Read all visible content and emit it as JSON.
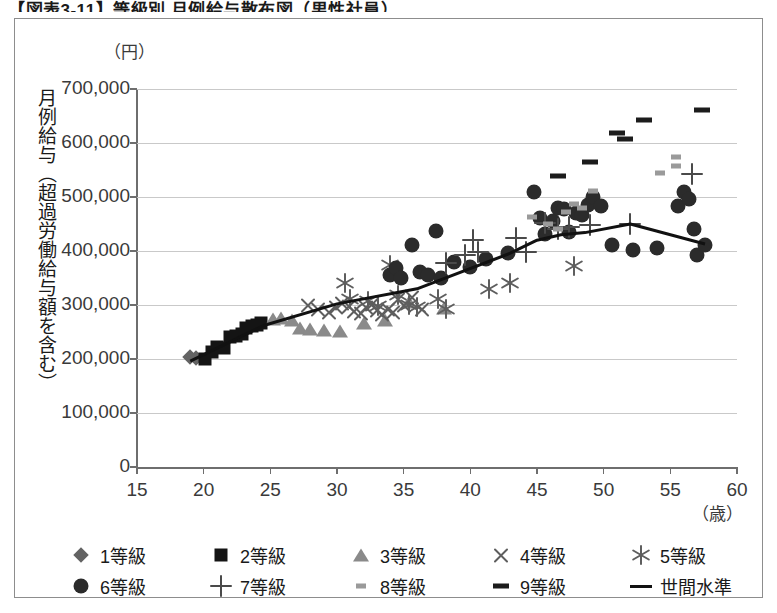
{
  "title": "【図表3-11】等級別 月例給与散布図（男性社員）",
  "axes": {
    "y_unit": "（円）",
    "y_title": "月例給与（超過労働給与額を含む）",
    "x_unit": "（歳）",
    "y_ticks": [
      "700,000",
      "600,000",
      "500,000",
      "400,000",
      "300,000",
      "200,000",
      "100,000",
      "0"
    ],
    "x_ticks": [
      "15",
      "20",
      "25",
      "30",
      "35",
      "40",
      "45",
      "50",
      "55",
      "60"
    ]
  },
  "legend": {
    "rows": [
      [
        {
          "label": "1等級",
          "marker": "diamond"
        },
        {
          "label": "2等級",
          "marker": "square"
        },
        {
          "label": "3等級",
          "marker": "triangle"
        },
        {
          "label": "4等級",
          "marker": "x"
        },
        {
          "label": "5等級",
          "marker": "asterisk"
        }
      ],
      [
        {
          "label": "6等級",
          "marker": "circle"
        },
        {
          "label": "7等級",
          "marker": "plus"
        },
        {
          "label": "8等級",
          "marker": "dash-small"
        },
        {
          "label": "9等級",
          "marker": "dash-large"
        },
        {
          "label": "世間水準",
          "marker": "line"
        }
      ]
    ]
  },
  "chart_data": {
    "type": "scatter",
    "title": "【図表3-11】等級別 月例給与散布図（男性社員）",
    "xlabel": "（歳）",
    "ylabel": "月例給与（超過労働給与額を含む）（円）",
    "xlim": [
      15,
      60
    ],
    "ylim": [
      0,
      700000
    ],
    "xtick_step": 5,
    "ytick_step": 100000,
    "grid": "horizontal",
    "legend_position": "bottom",
    "series": [
      {
        "name": "1等級",
        "marker": "diamond",
        "color": "#636363",
        "points": [
          [
            19.0,
            203000
          ],
          [
            19.4,
            201000
          ]
        ]
      },
      {
        "name": "2等級",
        "marker": "square",
        "color": "#141414",
        "points": [
          [
            20.1,
            200000
          ],
          [
            20.6,
            213000
          ],
          [
            21.0,
            222000
          ],
          [
            21.5,
            221000
          ],
          [
            22.0,
            240000
          ],
          [
            22.4,
            243000
          ],
          [
            22.9,
            247000
          ],
          [
            23.2,
            257000
          ],
          [
            23.6,
            262000
          ],
          [
            24.0,
            263000
          ],
          [
            24.3,
            266000
          ]
        ]
      },
      {
        "name": "3等級",
        "marker": "triangle",
        "color": "#8a8a8a",
        "points": [
          [
            25.2,
            274000
          ],
          [
            25.8,
            276000
          ],
          [
            26.6,
            272000
          ],
          [
            27.2,
            258000
          ],
          [
            28.0,
            256000
          ],
          [
            29.0,
            254000
          ],
          [
            30.2,
            252000
          ],
          [
            32.0,
            267000
          ],
          [
            33.6,
            272000
          ],
          [
            35.4,
            305000
          ],
          [
            38.0,
            294000
          ]
        ]
      },
      {
        "name": "4等級",
        "marker": "x",
        "color": "#5e5e5e",
        "points": [
          [
            27.8,
            300000
          ],
          [
            28.6,
            292000
          ],
          [
            29.4,
            287000
          ],
          [
            29.9,
            296000
          ],
          [
            30.4,
            303000
          ],
          [
            30.9,
            298000
          ],
          [
            31.3,
            288000
          ],
          [
            31.8,
            284000
          ],
          [
            32.2,
            296000
          ],
          [
            32.6,
            301000
          ],
          [
            33.0,
            290000
          ],
          [
            33.4,
            283000
          ],
          [
            33.8,
            292000
          ],
          [
            34.2,
            287000
          ],
          [
            34.6,
            310000
          ],
          [
            35.0,
            300000
          ],
          [
            35.6,
            313000
          ],
          [
            36.4,
            292000
          ]
        ]
      },
      {
        "name": "5等級",
        "marker": "asterisk",
        "color": "#5e5e5e",
        "points": [
          [
            30.6,
            340000
          ],
          [
            31.0,
            312000
          ],
          [
            32.3,
            307000
          ],
          [
            33.1,
            298000
          ],
          [
            34.0,
            375000
          ],
          [
            34.6,
            318000
          ],
          [
            35.4,
            300000
          ],
          [
            36.0,
            296000
          ],
          [
            37.6,
            312000
          ],
          [
            38.2,
            293000
          ],
          [
            41.4,
            330000
          ],
          [
            43.0,
            340000
          ],
          [
            47.8,
            372000
          ]
        ]
      },
      {
        "name": "6等級",
        "marker": "circle",
        "color": "#2b2b2b",
        "points": [
          [
            34.0,
            355000
          ],
          [
            34.4,
            368000
          ],
          [
            34.8,
            350000
          ],
          [
            35.6,
            412000
          ],
          [
            36.2,
            362000
          ],
          [
            36.8,
            355000
          ],
          [
            37.4,
            437000
          ],
          [
            37.8,
            350000
          ],
          [
            38.8,
            380000
          ],
          [
            40.0,
            370000
          ],
          [
            41.2,
            386000
          ],
          [
            42.8,
            396000
          ],
          [
            44.8,
            510000
          ],
          [
            45.2,
            462000
          ],
          [
            45.6,
            432000
          ],
          [
            46.2,
            455000
          ],
          [
            46.6,
            480000
          ],
          [
            47.0,
            478000
          ],
          [
            47.4,
            435000
          ],
          [
            47.9,
            470000
          ],
          [
            48.4,
            466000
          ],
          [
            48.8,
            485000
          ],
          [
            49.2,
            500000
          ],
          [
            49.8,
            484000
          ],
          [
            50.6,
            412000
          ],
          [
            52.2,
            402000
          ],
          [
            54.0,
            405000
          ],
          [
            55.6,
            484000
          ],
          [
            56.0,
            510000
          ],
          [
            56.4,
            497000
          ],
          [
            56.8,
            440000
          ],
          [
            57.0,
            392000
          ],
          [
            57.6,
            412000
          ]
        ]
      },
      {
        "name": "7等級",
        "marker": "plus",
        "color": "#4a4a4a",
        "points": [
          [
            38.2,
            378000
          ],
          [
            39.6,
            392000
          ],
          [
            40.2,
            420000
          ],
          [
            40.6,
            398000
          ],
          [
            43.4,
            424000
          ],
          [
            44.2,
            398000
          ],
          [
            45.6,
            452000
          ],
          [
            46.6,
            440000
          ],
          [
            47.4,
            445000
          ],
          [
            49.0,
            448000
          ],
          [
            52.0,
            450000
          ],
          [
            56.6,
            543000
          ]
        ]
      },
      {
        "name": "8等級",
        "marker": "dash-small",
        "color": "#9a9a9a",
        "points": [
          [
            44.6,
            463000
          ],
          [
            45.8,
            450000
          ],
          [
            46.6,
            440000
          ],
          [
            47.2,
            472000
          ],
          [
            47.8,
            487000
          ],
          [
            48.4,
            480000
          ],
          [
            49.2,
            512000
          ],
          [
            54.2,
            545000
          ],
          [
            55.4,
            575000
          ],
          [
            55.4,
            557000
          ]
        ]
      },
      {
        "name": "9等級",
        "marker": "dash-large",
        "color": "#1c1c1c",
        "points": [
          [
            46.6,
            538000
          ],
          [
            49.0,
            565000
          ],
          [
            51.0,
            618000
          ],
          [
            51.6,
            608000
          ],
          [
            53.0,
            642000
          ],
          [
            57.4,
            662000
          ]
        ]
      }
    ],
    "trendline": {
      "name": "世間水準",
      "marker": "line",
      "color": "#111111",
      "points": [
        [
          19.0,
          196000
        ],
        [
          24.5,
          262000
        ],
        [
          30.0,
          302000
        ],
        [
          36.0,
          330000
        ],
        [
          43.0,
          396000
        ],
        [
          45.0,
          420000
        ],
        [
          46.8,
          430000
        ],
        [
          48.6,
          434000
        ],
        [
          52.0,
          450000
        ],
        [
          57.6,
          413000
        ]
      ]
    }
  }
}
